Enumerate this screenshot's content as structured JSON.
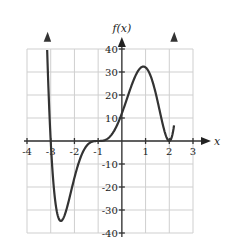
{
  "chart_data": {
    "type": "line",
    "title": "",
    "xlabel": "x",
    "ylabel": "f(x)",
    "xlim": [
      -4,
      3
    ],
    "ylim": [
      -40,
      40
    ],
    "grid": true,
    "x_ticks": [
      -4,
      -3,
      -2,
      -1,
      1,
      2,
      3
    ],
    "x_tick_labels": [
      "-4",
      "-3",
      "-2",
      "-1",
      "1",
      "2",
      "3"
    ],
    "y_ticks": [
      40,
      30,
      20,
      10,
      -10,
      -20,
      -30,
      -40
    ],
    "y_tick_labels": [
      "40",
      "30",
      "20",
      "10",
      "-10",
      "-20",
      "-30",
      "-40"
    ],
    "series": [
      {
        "name": "f(x)",
        "description": "polynomial f(x)=(x+3)(x+1)^3(x-2)^2 with arrows at both ends",
        "x": [
          -3.15,
          -3.0,
          -2.8,
          -2.5,
          -2.2,
          -2.0,
          -1.5,
          -1.0,
          -0.5,
          0.0,
          0.5,
          1.0,
          1.5,
          2.0,
          2.2
        ],
        "y": [
          40,
          0,
          -25.2,
          -34.2,
          -28.9,
          -16,
          -2.8,
          0,
          1.97,
          12,
          23.6,
          32,
          20.5,
          0,
          44.6
        ]
      }
    ],
    "zeros": [
      -3,
      -1,
      2
    ],
    "local_min": {
      "x": -2.5,
      "y": -34.2
    },
    "local_max": {
      "x": 1,
      "y": 32
    }
  }
}
